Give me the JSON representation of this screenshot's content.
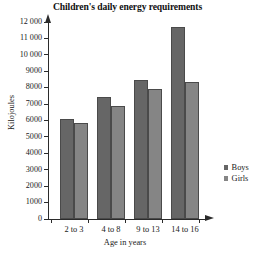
{
  "chart_data": {
    "type": "bar",
    "title": "Children's daily energy requirements",
    "xlabel": "Age in years",
    "ylabel": "Kilojoules",
    "categories": [
      "2 to 3",
      "4 to 8",
      "9 to 13",
      "14 to 16"
    ],
    "series": [
      {
        "name": "Boys",
        "values": [
          6100,
          7450,
          8450,
          11700
        ],
        "color": "#666666"
      },
      {
        "name": "Girls",
        "values": [
          5850,
          6900,
          7950,
          8350
        ],
        "color": "#858585"
      }
    ],
    "ylim": [
      0,
      12000
    ],
    "ytick_values": [
      0,
      1000,
      2000,
      3000,
      4000,
      5000,
      6000,
      7000,
      8000,
      9000,
      10000,
      11000,
      12000
    ],
    "ytick_labels": [
      "0",
      "1000",
      "2000",
      "3000",
      "4000",
      "5000",
      "6000",
      "7000",
      "8000",
      "9000",
      "10 000",
      "11 000",
      "12 000"
    ],
    "grid": false,
    "legend_position": "right"
  },
  "legend": {
    "entries": [
      {
        "label": "Boys",
        "swatch": "legend-swatch-boys"
      },
      {
        "label": "Girls",
        "swatch": "legend-swatch-girls"
      }
    ]
  },
  "colors": {
    "boys": "#666666",
    "girls": "#858585",
    "axis": "#2b2b2b",
    "background": "#ffffff",
    "text": "#1a1a1a"
  }
}
